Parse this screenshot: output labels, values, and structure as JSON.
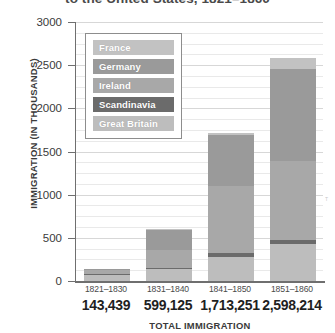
{
  "chart": {
    "title": "to the United States, 1821–1860",
    "xaxis_title": "TOTAL IMMIGRATION",
    "yaxis_title": "IMMIGRATION (IN THOUSANDS)"
  },
  "legend": {
    "items": [
      {
        "label": "France",
        "color": "#c2c2c2"
      },
      {
        "label": "Germany",
        "color": "#9a9a9a"
      },
      {
        "label": "Ireland",
        "color": "#a8a8a8"
      },
      {
        "label": "Scandinavia",
        "color": "#6b6b6b"
      },
      {
        "label": "Great Britain",
        "color": "#bdbdbd"
      }
    ]
  },
  "chart_data": {
    "type": "bar",
    "stacked": true,
    "title": "to the United States, 1821–1860",
    "xlabel": "TOTAL IMMIGRATION",
    "ylabel": "IMMIGRATION (IN THOUSANDS)",
    "ylim": [
      0,
      3000
    ],
    "yticks": [
      0,
      500,
      1000,
      1500,
      2000,
      2500,
      3000
    ],
    "grid": true,
    "legend_position": "inside-upper-left",
    "categories": [
      "1821–1830",
      "1831–1840",
      "1841–1850",
      "1851–1860"
    ],
    "totals_label": [
      "143,439",
      "599,125",
      "1,713,251",
      "2,598,214"
    ],
    "totals": [
      143439,
      599125,
      1713251,
      2598214
    ],
    "series": [
      {
        "name": "Great Britain",
        "color": "#bdbdbd",
        "values": [
          75,
          140,
          280,
          425
        ]
      },
      {
        "name": "Scandinavia",
        "color": "#6b6b6b",
        "values": [
          5,
          15,
          40,
          45
        ]
      },
      {
        "name": "Ireland",
        "color": "#a8a8a8",
        "values": [
          50,
          210,
          780,
          915
        ]
      },
      {
        "name": "Germany",
        "color": "#9a9a9a",
        "values": [
          10,
          225,
          595,
          1070
        ]
      },
      {
        "name": "France",
        "color": "#c2c2c2",
        "values": [
          3,
          10,
          18,
          125
        ]
      }
    ]
  }
}
